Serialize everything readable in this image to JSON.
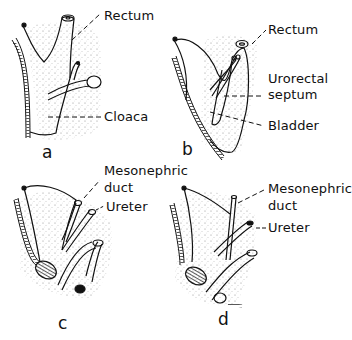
{
  "panels": [
    {
      "id": "a",
      "letter": "a",
      "labels": {
        "rectum": "Rectum",
        "cloaca": "Cloaca"
      }
    },
    {
      "id": "b",
      "letter": "b",
      "labels": {
        "rectum": "Rectum",
        "urorectal_line1": "Urorectal",
        "urorectal_line2": "septum",
        "bladder": "Bladder"
      }
    },
    {
      "id": "c",
      "letter": "c",
      "labels": {
        "meso_line1": "Mesonephric",
        "meso_line2": "duct",
        "ureter": "Ureter"
      }
    },
    {
      "id": "d",
      "letter": "d",
      "labels": {
        "meso_line1": "Mesonephric",
        "meso_line2": "duct",
        "ureter": "Ureter"
      }
    }
  ],
  "colors": {
    "ink": "#111111",
    "stipple": "#9a9a9a",
    "background": "#ffffff"
  }
}
